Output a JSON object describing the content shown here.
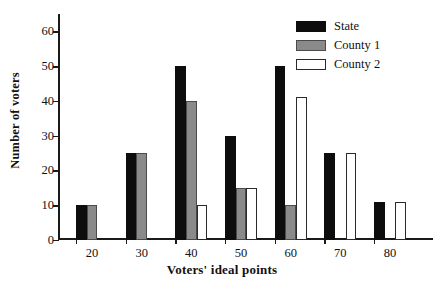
{
  "chart_data": {
    "type": "bar",
    "title": "",
    "xlabel": "Voters' ideal points",
    "ylabel": "Number of voters",
    "categories": [
      "20",
      "30",
      "40",
      "50",
      "60",
      "70",
      "80"
    ],
    "series": [
      {
        "name": "State",
        "color": "#0d0d0d",
        "values": [
          10,
          25,
          50,
          30,
          50,
          25,
          11
        ]
      },
      {
        "name": "County 1",
        "color": "#8a8a8a",
        "values": [
          10,
          25,
          40,
          15,
          10,
          0,
          0
        ]
      },
      {
        "name": "County 2",
        "color": "#ffffff",
        "values": [
          0,
          0,
          10,
          15,
          41,
          25,
          11
        ]
      }
    ],
    "ylim": [
      0,
      65
    ],
    "yticks": [
      0,
      10,
      20,
      30,
      40,
      50,
      60
    ],
    "ytick_labels": [
      "0",
      "10",
      "20",
      "30",
      "40",
      "50",
      "60"
    ],
    "xtick_labels": [
      "20",
      "30",
      "40",
      "50",
      "60",
      "70",
      "80"
    ],
    "grid": false,
    "legend_position": "top-right",
    "legend_entries": [
      "State",
      "County 1",
      "County 2"
    ]
  }
}
